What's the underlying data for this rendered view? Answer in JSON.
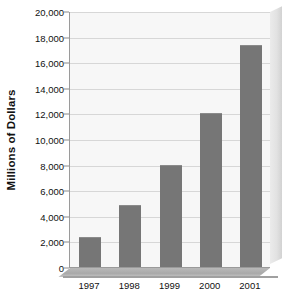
{
  "chart_data": {
    "type": "bar",
    "title": "",
    "subtitle": "",
    "xlabel": "",
    "ylabel": "Millions of Dollars",
    "categories": [
      "1997",
      "1998",
      "1999",
      "2000",
      "2001"
    ],
    "values": [
      2320,
      4880,
      7950,
      12000,
      17350
    ],
    "series": [
      {
        "name": "Millions of Dollars",
        "values": [
          2320,
          4880,
          7950,
          12000,
          17350
        ]
      }
    ],
    "ylim": [
      0,
      20000
    ],
    "ytick_step": 2000,
    "ytick_labels": [
      "20,000",
      "18,000",
      "16,000",
      "14,000",
      "12,000",
      "10,000",
      "8,000",
      "6,000",
      "4,000",
      "2,000",
      "0"
    ],
    "ytick_values": [
      20000,
      18000,
      16000,
      14000,
      12000,
      10000,
      8000,
      6000,
      4000,
      2000,
      0
    ],
    "grid": true,
    "grid_axis": "y",
    "legend": false,
    "legend_position": "none",
    "annotations": [],
    "style": "3d-side-panel"
  },
  "colors": {
    "bar": "#767676",
    "bar_top_edge": "#8b8b8b",
    "plot_background": "#f7f7f7",
    "page_background": "#ffffff",
    "gridline": "#d7d7d7",
    "axis_line": "#9a9a9a",
    "tick_mark": "#8a8a8a",
    "text": "#111111",
    "panel_3d": "#e2e2e2",
    "floor_3d": "#a9a9a9"
  }
}
